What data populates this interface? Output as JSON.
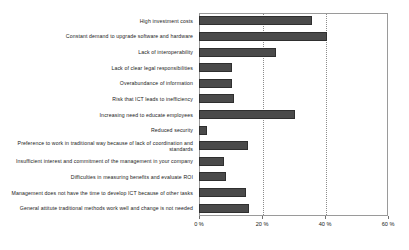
{
  "chart_data": {
    "type": "bar",
    "orientation": "horizontal",
    "title": "",
    "subtitle": "",
    "xlabel": "",
    "ylabel": "",
    "xlim": [
      0,
      60
    ],
    "ylim": null,
    "grid": true,
    "gridlines_axis": "x",
    "legend": null,
    "legend_position": "none",
    "bar_color": "#4a4a4a",
    "bar_border_color": "#2f2f2f",
    "frame_color": "#9a9a9a",
    "background_color": "#ffffff",
    "xtick_labels": [
      "0 %",
      "20 %",
      "40 %",
      "60 %"
    ],
    "xtick_values": [
      0,
      20,
      40,
      60
    ],
    "categories": [
      "High investment costs",
      "Constant demand to upgrade software and hardware",
      "Lack of interoperability",
      "Lack of clear legal responsibilities",
      "Overabundance of information",
      "Risk that ICT leads to inefficiency",
      "Increasing need to educate employees",
      "Reduced security",
      "Preference to work in traditional way because of lack of coordination and standards",
      "Insufficient interest and commitment of the management in your company",
      "Difficulties in measuring benefits and evaluate ROI",
      "Management does not have the time to develop ICT because of other tasks",
      "General attitute traditional methods work well and change is not needed"
    ],
    "values": [
      36,
      40.5,
      24.5,
      10.5,
      10.5,
      11,
      30.5,
      2.5,
      15.5,
      8,
      8.5,
      15,
      16
    ]
  }
}
